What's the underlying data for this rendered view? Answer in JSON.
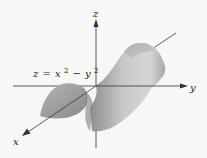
{
  "diagram": {
    "type": "3d-surface-plot",
    "surface": "hyperbolic paraboloid (saddle)",
    "equation": {
      "lhs": "z",
      "equals": "=",
      "term1": "x",
      "exp1": "2",
      "minus": "−",
      "term2": "y",
      "exp2": "2"
    },
    "axes": {
      "x": "x",
      "y": "y",
      "z": "z"
    },
    "colors": {
      "background": "#f7f7f5",
      "axis": "#333333",
      "surface_light": "#cfcfcf",
      "surface_dark": "#8c8c8c",
      "text": "#222222"
    }
  }
}
